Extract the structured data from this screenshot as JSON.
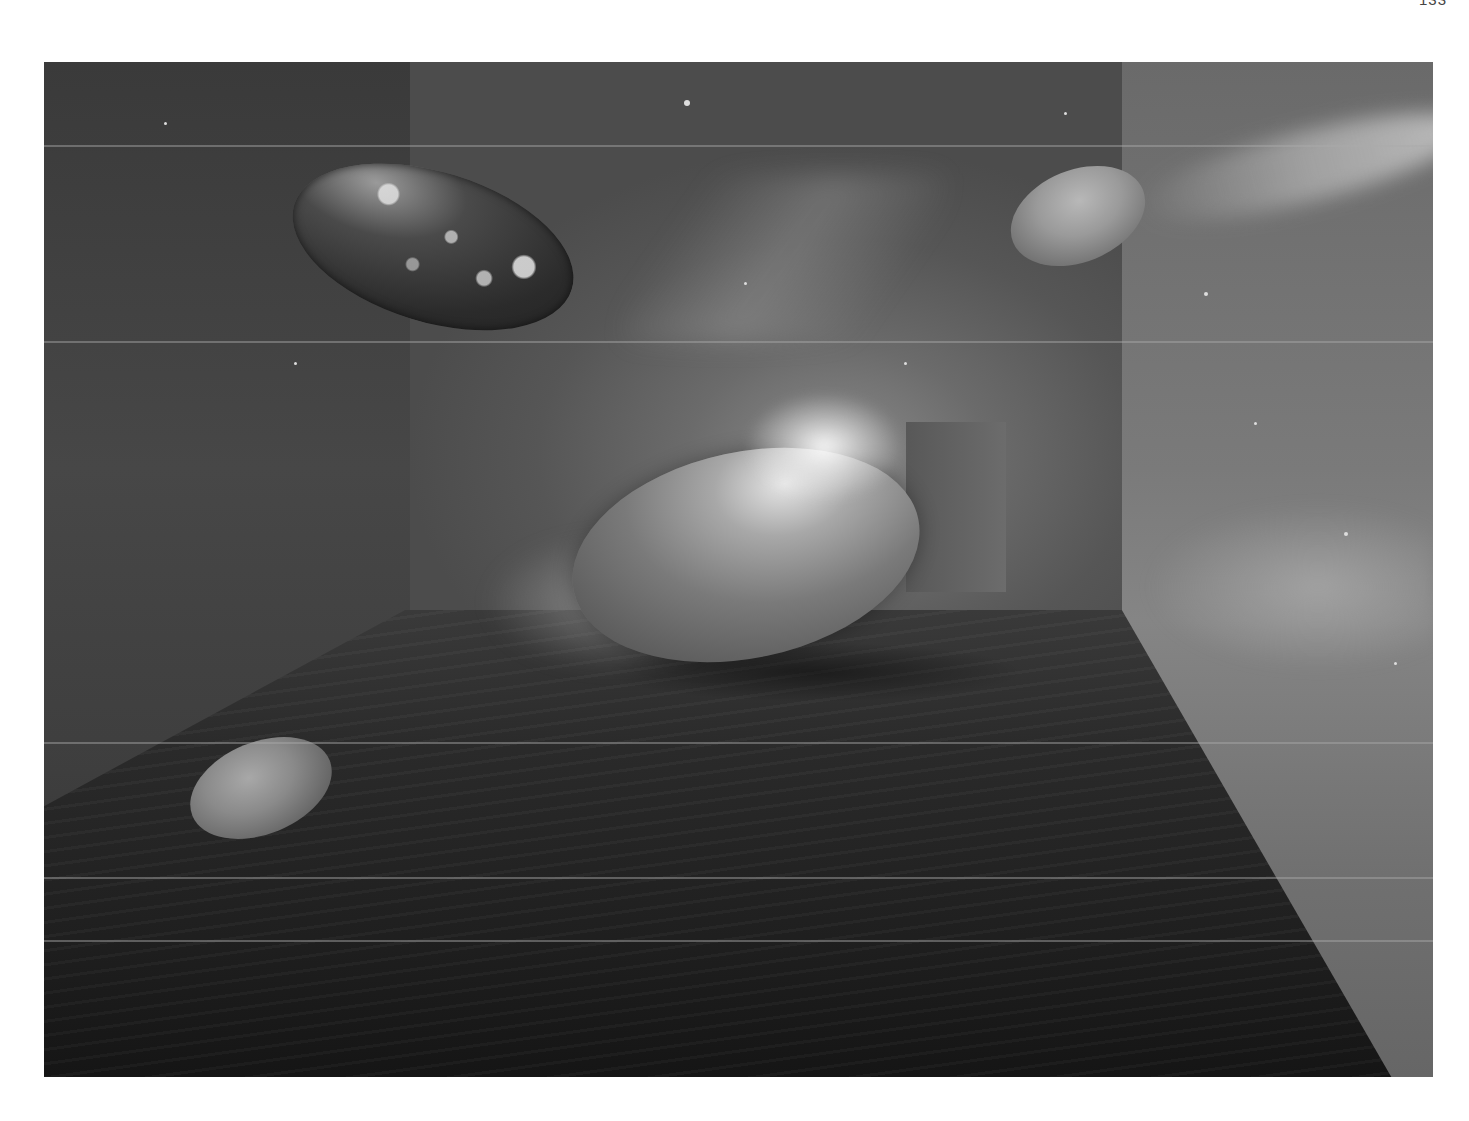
{
  "page": {
    "page_number": "133"
  },
  "artwork": {
    "description": "Grayscale space scene: room with starfield walls, four egg-shaped planets floating",
    "palette": {
      "background": "#ffffff",
      "wall_dark": "#3a3a3a",
      "wall_light": "#7a7a7a",
      "floor": "#1f1f1f",
      "highlight": "#e6e6e6"
    },
    "objects": [
      {
        "name": "cratered-planet",
        "position": "upper-left"
      },
      {
        "name": "small-planet",
        "position": "upper-right"
      },
      {
        "name": "large-planet",
        "position": "center",
        "feature": "bright flare on top"
      },
      {
        "name": "floor-planet",
        "position": "lower-left"
      }
    ],
    "scanlines_y": [
      83,
      279,
      680,
      815,
      878
    ]
  }
}
